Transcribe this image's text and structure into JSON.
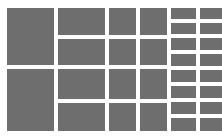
{
  "canvas": {
    "width": 222,
    "height": 139,
    "background_color": "#ffffff",
    "block_color": "#6e6e6e",
    "gap_horizontal": 4,
    "gap_vertical": 4,
    "padding_top": 8,
    "padding_right": 5,
    "padding_bottom": 8,
    "padding_left": 7
  },
  "layout": {
    "type": "placeholder-grid",
    "column_count": 6,
    "description": "Gray rectangular placeholder blocks arranged in six vertical columns of increasing density on a white background."
  },
  "columns": [
    {
      "name": "column-1",
      "width_px": 47,
      "row_count": 2,
      "blocks": [
        {
          "name": "block-1-1",
          "height_px": 57,
          "color": "#6e6e6e"
        },
        {
          "name": "block-1-2",
          "height_px": 62,
          "color": "#6e6e6e"
        }
      ]
    },
    {
      "name": "column-2",
      "width_px": 47,
      "row_count": 4,
      "blocks": [
        {
          "name": "block-2-1",
          "height_px": 27,
          "color": "#6e6e6e"
        },
        {
          "name": "block-2-2",
          "height_px": 26,
          "color": "#6e6e6e"
        },
        {
          "name": "block-2-3",
          "height_px": 30,
          "color": "#6e6e6e"
        },
        {
          "name": "block-2-4",
          "height_px": 28,
          "color": "#6e6e6e"
        }
      ]
    },
    {
      "name": "column-3",
      "width_px": 27,
      "row_count": 4,
      "blocks": [
        {
          "name": "block-3-1",
          "height_px": 27,
          "color": "#6e6e6e"
        },
        {
          "name": "block-3-2",
          "height_px": 26,
          "color": "#6e6e6e"
        },
        {
          "name": "block-3-3",
          "height_px": 30,
          "color": "#6e6e6e"
        },
        {
          "name": "block-3-4",
          "height_px": 28,
          "color": "#6e6e6e"
        }
      ]
    },
    {
      "name": "column-4",
      "width_px": 27,
      "row_count": 4,
      "blocks": [
        {
          "name": "block-4-1",
          "height_px": 27,
          "color": "#6e6e6e"
        },
        {
          "name": "block-4-2",
          "height_px": 26,
          "color": "#6e6e6e"
        },
        {
          "name": "block-4-3",
          "height_px": 30,
          "color": "#6e6e6e"
        },
        {
          "name": "block-4-4",
          "height_px": 28,
          "color": "#6e6e6e"
        }
      ]
    },
    {
      "name": "column-5",
      "width_px": 25,
      "row_count": 8,
      "blocks": [
        {
          "name": "block-5-1",
          "height_px": 12,
          "color": "#6e6e6e"
        },
        {
          "name": "block-5-2",
          "height_px": 12,
          "color": "#6e6e6e"
        },
        {
          "name": "block-5-3",
          "height_px": 13,
          "color": "#6e6e6e"
        },
        {
          "name": "block-5-4",
          "height_px": 13,
          "color": "#6e6e6e"
        },
        {
          "name": "block-5-5",
          "height_px": 13,
          "color": "#6e6e6e"
        },
        {
          "name": "block-5-6",
          "height_px": 13,
          "color": "#6e6e6e"
        },
        {
          "name": "block-5-7",
          "height_px": 13,
          "color": "#6e6e6e"
        },
        {
          "name": "block-5-8",
          "height_px": 14,
          "color": "#6e6e6e"
        }
      ]
    },
    {
      "name": "column-6",
      "width_px": 25,
      "row_count": 8,
      "blocks": [
        {
          "name": "block-6-1",
          "height_px": 12,
          "color": "#6e6e6e"
        },
        {
          "name": "block-6-2",
          "height_px": 12,
          "color": "#6e6e6e"
        },
        {
          "name": "block-6-3",
          "height_px": 13,
          "color": "#6e6e6e"
        },
        {
          "name": "block-6-4",
          "height_px": 13,
          "color": "#6e6e6e"
        },
        {
          "name": "block-6-5",
          "height_px": 13,
          "color": "#6e6e6e"
        },
        {
          "name": "block-6-6",
          "height_px": 13,
          "color": "#6e6e6e"
        },
        {
          "name": "block-6-7",
          "height_px": 13,
          "color": "#6e6e6e"
        },
        {
          "name": "block-6-8",
          "height_px": 14,
          "color": "#6e6e6e"
        }
      ]
    }
  ]
}
